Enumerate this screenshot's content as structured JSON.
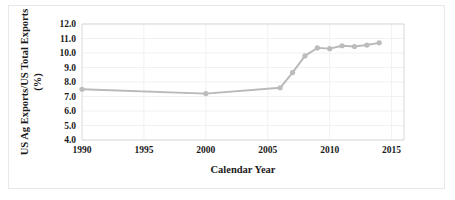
{
  "chart_data": {
    "type": "line",
    "title": "",
    "xlabel": "Calendar Year",
    "ylabel": "US Ag Exports/US Total Exports (%)",
    "ylabel_line1": "US Ag Exports/US Total Exports",
    "ylabel_line2": "(%)",
    "xlim": [
      1990,
      2016
    ],
    "ylim": [
      4.0,
      12.0
    ],
    "grid": true,
    "legend": "none",
    "series_color": "#bcbcbe",
    "x_ticks": [
      "1990",
      "1995",
      "2000",
      "2005",
      "2010",
      "2015"
    ],
    "x_tick_values": [
      1990,
      1995,
      2000,
      2005,
      2010,
      2015
    ],
    "y_ticks": [
      "4.0",
      "5.0",
      "6.0",
      "7.0",
      "8.0",
      "9.0",
      "10.0",
      "11.0",
      "12.0"
    ],
    "y_tick_values": [
      4.0,
      5.0,
      6.0,
      7.0,
      8.0,
      9.0,
      10.0,
      11.0,
      12.0
    ],
    "x": [
      1990,
      2000,
      2006,
      2007,
      2008,
      2009,
      2010,
      2011,
      2012,
      2013,
      2014
    ],
    "values": [
      7.5,
      7.2,
      7.6,
      8.65,
      9.8,
      10.35,
      10.3,
      10.5,
      10.45,
      10.55,
      10.7
    ],
    "series": [
      {
        "name": "US Ag Exports share of US Total Exports",
        "values": [
          7.5,
          7.2,
          7.6,
          8.65,
          9.8,
          10.35,
          10.3,
          10.5,
          10.45,
          10.55,
          10.7
        ]
      }
    ]
  }
}
